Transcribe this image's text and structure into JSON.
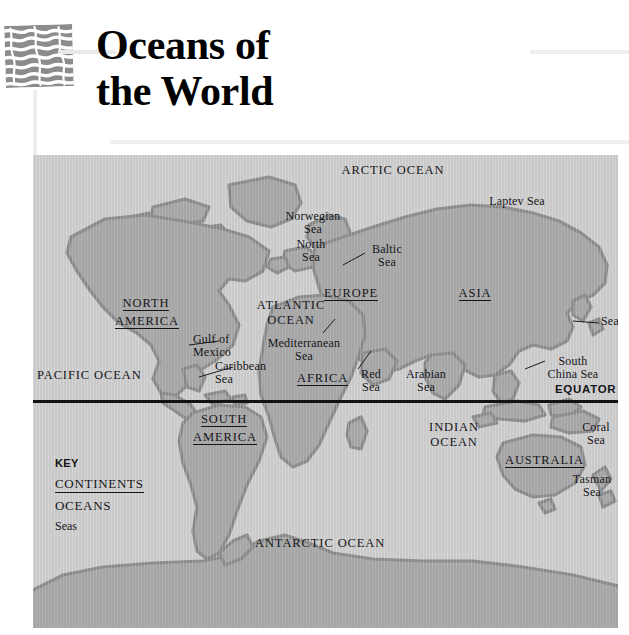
{
  "header": {
    "title_line1": "Oceans of",
    "title_line2": "the World",
    "icon_name": "wave-pattern-icon"
  },
  "map": {
    "equator_label": "EQUATOR",
    "oceans": [
      {
        "name": "ARCTIC OCEAN",
        "x": 305,
        "y": 16,
        "w": 110
      },
      {
        "name": "ATLANTIC\nOCEAN",
        "x": 222,
        "y": 150,
        "w": 72
      },
      {
        "name": "PACIFIC OCEAN",
        "x": 6,
        "y": 218,
        "w": 98
      },
      {
        "name": "INDIAN\nOCEAN",
        "x": 392,
        "y": 272,
        "w": 58
      },
      {
        "name": "ANTARCTIC OCEAN",
        "x": 222,
        "y": 387,
        "w": 122
      }
    ],
    "continents": [
      {
        "name": "NORTH\nAMERICA",
        "x": 82,
        "y": 145,
        "w": 62
      },
      {
        "name": "SOUTH\nAMERICA",
        "x": 160,
        "y": 261,
        "w": 62
      },
      {
        "name": "EUROPE",
        "x": 291,
        "y": 133,
        "w": 48
      },
      {
        "name": "AFRICA",
        "x": 265,
        "y": 218,
        "w": 44
      },
      {
        "name": "ASIA",
        "x": 425,
        "y": 133,
        "w": 32
      },
      {
        "name": "AUSTRALIA",
        "x": 474,
        "y": 300,
        "w": 62
      }
    ],
    "seas": [
      {
        "name": "Norwegian\nSea",
        "x": 250,
        "y": 60,
        "w": 60
      },
      {
        "name": "North\nSea",
        "x": 258,
        "y": 88,
        "w": 42
      },
      {
        "name": "Baltic\nSea",
        "x": 334,
        "y": 93,
        "w": 40
      },
      {
        "name": "Laptev Sea",
        "x": 450,
        "y": 44,
        "w": 68
      },
      {
        "name": "Sea of Japan",
        "x": 533,
        "y": 163,
        "w": 72
      },
      {
        "name": "Gulf of\nMexico",
        "x": 160,
        "y": 182,
        "w": 52
      },
      {
        "name": "Caribbean\nSea",
        "x": 182,
        "y": 209,
        "w": 60
      },
      {
        "name": "Mediterranean\nSea",
        "x": 262,
        "y": 186,
        "w": 82
      },
      {
        "name": "Red\nSea",
        "x": 327,
        "y": 218,
        "w": 28
      },
      {
        "name": "Arabian\nSea",
        "x": 372,
        "y": 218,
        "w": 46
      },
      {
        "name": "South\nChina Sea",
        "x": 510,
        "y": 205,
        "w": 62
      },
      {
        "name": "Coral\nSea",
        "x": 545,
        "y": 270,
        "w": 38
      },
      {
        "name": "Tasman\nSea",
        "x": 536,
        "y": 323,
        "w": 46
      }
    ]
  },
  "key": {
    "title": "KEY",
    "continents_label": "CONTINENTS",
    "oceans_label": "OCEANS",
    "seas_label": "Seas"
  },
  "colors": {
    "ocean": "#c9c9c9",
    "land": "#a2a2a2",
    "coast": "#8b8b8b",
    "equator": "#121212",
    "text": "#16161a"
  }
}
